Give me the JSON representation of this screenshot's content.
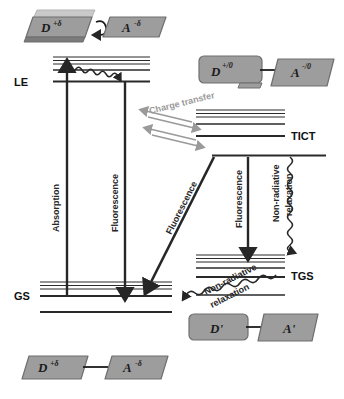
{
  "figure": {
    "type": "energy-level-diagram",
    "background": "#ffffff",
    "ink_color": "#222222",
    "gray_color": "#9a9a9a",
    "molecule_fill": "#9d9d9d",
    "molecule_fill_light": "#c9c9c9",
    "molecule_fill_dark": "#7b7b7b",
    "molecule_stroke": "#6f6f6f"
  },
  "states": [
    {
      "id": "LE",
      "label": "LE",
      "x": 14,
      "y": 82,
      "desc": "locally excited state"
    },
    {
      "id": "TICT",
      "label": "TICT",
      "x": 291,
      "y": 137,
      "desc": "twisted intramolecular charge transfer state"
    },
    {
      "id": "GS",
      "label": "GS",
      "x": 14,
      "y": 300,
      "desc": "ground state"
    },
    {
      "id": "TGS",
      "label": "TGS",
      "x": 291,
      "y": 277,
      "desc": "twisted ground state"
    }
  ],
  "processes": [
    {
      "id": "absorption",
      "label": "Absorption",
      "style": "solid-arrow",
      "orientation": "vertical",
      "direction": "up",
      "color": "#262626"
    },
    {
      "id": "fluorescence-le",
      "label": "Fluorescence",
      "style": "solid-arrow",
      "orientation": "vertical",
      "direction": "down",
      "color": "#262626"
    },
    {
      "id": "charge-transfer",
      "label": "Charge transfer",
      "style": "double-arrow",
      "orientation": "diagonal",
      "direction": "both",
      "color": "#9a9a9a"
    },
    {
      "id": "fluorescence-tict-gs",
      "label": "Fluorescence",
      "style": "solid-arrow",
      "orientation": "diagonal",
      "direction": "down-left",
      "color": "#262626"
    },
    {
      "id": "fluorescence-tict",
      "label": "Fluorescence",
      "style": "solid-arrow",
      "orientation": "vertical",
      "direction": "down",
      "color": "#262626"
    },
    {
      "id": "non-radiative-tict",
      "label": "Non-radiative\nrelaxation",
      "label_line1": "Non-radiative",
      "label_line2": "relaxation",
      "style": "wavy-arrow",
      "orientation": "vertical",
      "direction": "down",
      "color": "#262626"
    },
    {
      "id": "non-radiative-gs",
      "label": "Non-radiative\nrelaxation",
      "label_line1": "Non-radiative",
      "label_line2": "relaxation",
      "style": "wavy-arrow",
      "orientation": "diagonal",
      "direction": "down-left",
      "color": "#262626"
    },
    {
      "id": "internal-conversion",
      "label": "",
      "style": "wavy-arrow",
      "orientation": "diagonal",
      "direction": "down-right",
      "color": "#262626"
    }
  ],
  "molecules": [
    {
      "id": "mol-le-excited",
      "position": "top-left",
      "donor": {
        "symbol": "D",
        "charge": "+δ"
      },
      "acceptor": {
        "symbol": "A",
        "charge": "-δ"
      },
      "linker": "curved-arrow",
      "stacked": true
    },
    {
      "id": "mol-tict",
      "position": "upper-right",
      "donor": {
        "symbol": "D",
        "charge": "+/0"
      },
      "acceptor": {
        "symbol": "A",
        "charge": "-/0"
      },
      "linker": "straight-line",
      "stacked": false
    },
    {
      "id": "mol-tgs",
      "position": "lower-right",
      "donor": {
        "symbol": "D'",
        "charge": ""
      },
      "acceptor": {
        "symbol": "A'",
        "charge": ""
      },
      "linker": "straight-line",
      "stacked": false
    },
    {
      "id": "mol-gs",
      "position": "bottom-left",
      "donor": {
        "symbol": "D",
        "charge": "+δ"
      },
      "acceptor": {
        "symbol": "A",
        "charge": "-δ"
      },
      "linker": "straight-line",
      "stacked": false
    }
  ],
  "labels": {
    "le": "LE",
    "tict": "TICT",
    "gs": "GS",
    "tgs": "TGS",
    "absorption": "Absorption",
    "fluorescence": "Fluorescence",
    "fluorescence_diag": "Fluorescence",
    "fluorescence_tict": "Fluorescence",
    "charge_transfer": "Charge transfer",
    "nonradiative_1": "Non-radiative",
    "nonradiative_2": "relaxation",
    "nonradiative_gs_1": "Non-radiative",
    "nonradiative_gs_2": "relaxation",
    "mol_d_delta": "D",
    "mol_d_delta_sup": "+δ",
    "mol_a_delta": "A",
    "mol_a_delta_sup": "-δ",
    "mol_d_ion": "D",
    "mol_d_ion_sup": "+/0",
    "mol_a_ion": "A",
    "mol_a_ion_sup": "-/0",
    "mol_d_prime": "D'",
    "mol_a_prime": "A'",
    "mol_d_delta2": "D",
    "mol_d_delta2_sup": "+δ",
    "mol_a_delta2": "A",
    "mol_a_delta2_sup": "-δ"
  }
}
